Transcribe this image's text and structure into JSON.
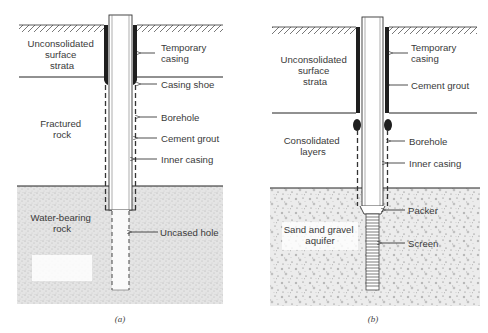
{
  "figure": {
    "panels": [
      {
        "id": "a",
        "caption": "(a)",
        "zones": [
          {
            "lines": [
              "Unconsolidated",
              "surface",
              "strata"
            ]
          },
          {
            "lines": [
              "Fractured",
              "rock"
            ]
          },
          {
            "lines": [
              "Water-bearing",
              "rock"
            ]
          }
        ],
        "callouts": [
          {
            "lines": [
              "Temporary",
              "casing"
            ]
          },
          {
            "lines": [
              "Casing shoe"
            ]
          },
          {
            "lines": [
              "Borehole"
            ]
          },
          {
            "lines": [
              "Cement grout"
            ]
          },
          {
            "lines": [
              "Inner casing"
            ]
          },
          {
            "lines": [
              "Uncased hole"
            ]
          }
        ]
      },
      {
        "id": "b",
        "caption": "(b)",
        "zones": [
          {
            "lines": [
              "Unconsolidated",
              "surface",
              "strata"
            ]
          },
          {
            "lines": [
              "Consolidated",
              "layers"
            ]
          },
          {
            "lines": [
              "Sand and gravel",
              "aquifer"
            ]
          }
        ],
        "callouts": [
          {
            "lines": [
              "Temporary",
              "casing"
            ]
          },
          {
            "lines": [
              "Cement grout"
            ]
          },
          {
            "lines": [
              "Borehole"
            ]
          },
          {
            "lines": [
              "Inner casing"
            ]
          },
          {
            "lines": [
              "Packer"
            ]
          },
          {
            "lines": [
              "Screen"
            ]
          }
        ]
      }
    ],
    "colors": {
      "line": "#1a1a1a",
      "text": "#3a3a3a",
      "stipple_bg": "#e6e6e6",
      "grout": "#222222"
    }
  }
}
